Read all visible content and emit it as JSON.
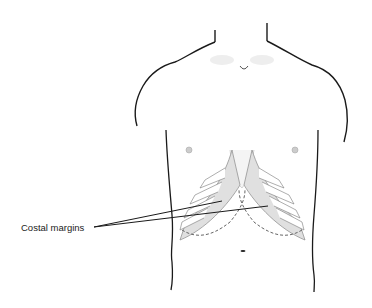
{
  "figure": {
    "labels": [
      {
        "text": "Costal margins",
        "pointer_count": 2
      }
    ]
  },
  "colors": {
    "outline": "#1a1a1a",
    "rib_shade": "#9a9a9a",
    "rib_fill": "#e8e8e8",
    "background": "#ffffff"
  }
}
